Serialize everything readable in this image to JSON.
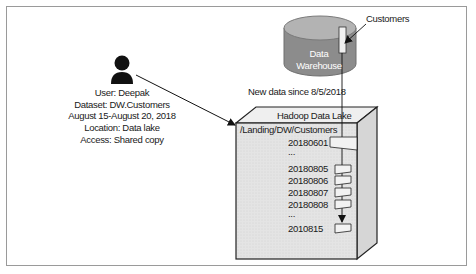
{
  "diagram": {
    "user": {
      "icon": "person-icon",
      "lines": [
        "User: Deepak",
        "Dataset: DW.Customers",
        "August 15-August 20, 2018",
        "Location: Data lake",
        "Access: Shared copy"
      ]
    },
    "warehouse": {
      "label_line1": "Data",
      "label_line2": "Warehouse",
      "table_label": "Customers",
      "color": "#8a8a8a"
    },
    "flow_label": "New data since 8/5/2018",
    "lake": {
      "title": "Hadoop Data Lake",
      "path": "/Landing/DW/Customers",
      "partitions": [
        "20180601",
        "...",
        "20180805",
        "20180806",
        "20180807",
        "20180808",
        "...",
        "2010815"
      ],
      "color": "#e6e6e6"
    }
  }
}
